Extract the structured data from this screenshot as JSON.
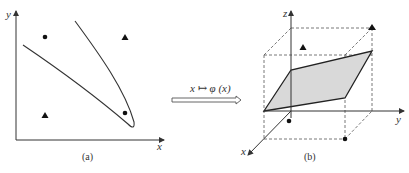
{
  "panel_a": {
    "caption": "(a)",
    "x_label": "x",
    "y_label": "y",
    "points": [
      {
        "shape": "circle",
        "position": "top-left"
      },
      {
        "shape": "triangle",
        "position": "top-right"
      },
      {
        "shape": "triangle",
        "position": "bottom-left"
      },
      {
        "shape": "circle",
        "position": "bottom-right"
      }
    ]
  },
  "mapping": {
    "label": "x ↦ φ (x)"
  },
  "panel_b": {
    "caption": "(b)",
    "x_label": "x",
    "y_label": "y",
    "z_label": "z",
    "plane_fill": "#d9d9d9"
  },
  "colors": {
    "ink": "#222222",
    "dashed": "#555555"
  }
}
